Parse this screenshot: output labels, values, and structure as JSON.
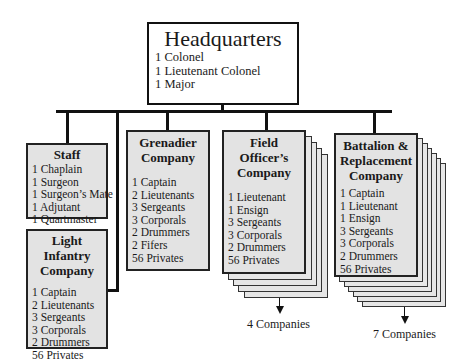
{
  "headquarters": {
    "title": "Headquarters",
    "items": [
      "1 Colonel",
      "1 Lieutenant Colonel",
      "1 Major"
    ]
  },
  "staff": {
    "title": "Staff",
    "items": [
      "1 Chaplain",
      "1 Surgeon",
      "1 Surgeon’s Mate",
      "1 Adjutant",
      "1 Quartmaster"
    ]
  },
  "light_infantry": {
    "title_line1": "Light Infantry",
    "title_line2": "Company",
    "items": [
      "1 Captain",
      "2 Lieutenants",
      "3 Sergeants",
      "3 Corporals",
      "2 Drummers",
      "56 Privates"
    ]
  },
  "grenadier": {
    "title_line1": "Grenadier",
    "title_line2": "Company",
    "items": [
      "1 Captain",
      "2 Lieutenants",
      "3 Sergeants",
      "3 Corporals",
      "2 Drummers",
      "2 Fifers",
      "56 Privates"
    ]
  },
  "field_officers": {
    "title_line1": "Field Officer’s",
    "title_line2": "Company",
    "items": [
      "1 Lieutenant",
      "1 Ensign",
      "3 Sergeants",
      "3 Corporals",
      "2 Drummers",
      "56 Privates"
    ],
    "count_label": "4 Companies"
  },
  "battalion": {
    "title_line1": "Battalion &",
    "title_line2": "Replacement",
    "title_line3": "Company",
    "items": [
      "1 Captain",
      "1 Lieutenant",
      "1 Ensign",
      "3 Sergeants",
      "3 Corporals",
      "2 Drummers",
      "56 Privates"
    ],
    "count_label": "7 Companies"
  },
  "colors": {
    "box_fill": "#e3e3e3",
    "hq_fill": "#ffffff",
    "line": "#111111"
  }
}
